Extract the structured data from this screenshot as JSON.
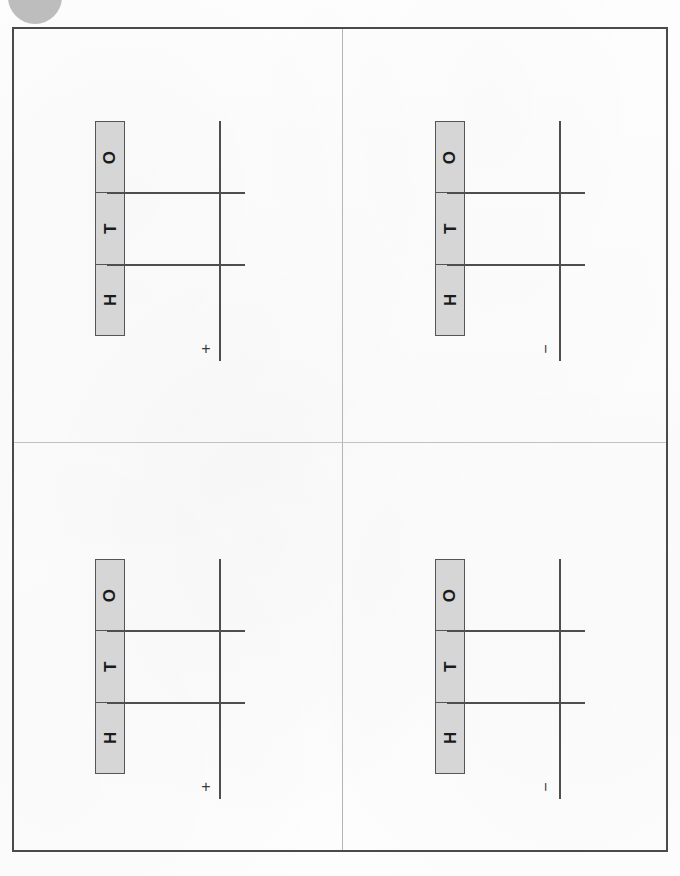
{
  "page": {
    "width": 680,
    "height": 876,
    "background_color": "#fdfdfd",
    "frame_color": "#4a4a4a",
    "divider_color": "#b5b5b5"
  },
  "marks": {
    "hole_punch": {
      "name": "hole-punch-mark",
      "color": "#b9b9b9",
      "description": ""
    }
  },
  "column_headers": {
    "labels": [
      "O",
      "T",
      "H"
    ],
    "fill_color": "#d6d6d6",
    "border_color": "#555555",
    "text_color": "#1b1b1b"
  },
  "rules": {
    "line_color": "#4e4e4e"
  },
  "panels": [
    {
      "id": "quadrant-top-left",
      "position": "top-left",
      "headers": [
        "O",
        "T",
        "H"
      ],
      "operator": "+",
      "operator_name": "plus-sign"
    },
    {
      "id": "quadrant-top-right",
      "position": "top-right",
      "headers": [
        "O",
        "T",
        "H"
      ],
      "operator": "−",
      "operator_name": "minus-sign"
    },
    {
      "id": "quadrant-bottom-left",
      "position": "bottom-left",
      "headers": [
        "O",
        "T",
        "H"
      ],
      "operator": "+",
      "operator_name": "plus-sign"
    },
    {
      "id": "quadrant-bottom-right",
      "position": "bottom-right",
      "headers": [
        "O",
        "T",
        "H"
      ],
      "operator": "−",
      "operator_name": "minus-sign"
    }
  ]
}
